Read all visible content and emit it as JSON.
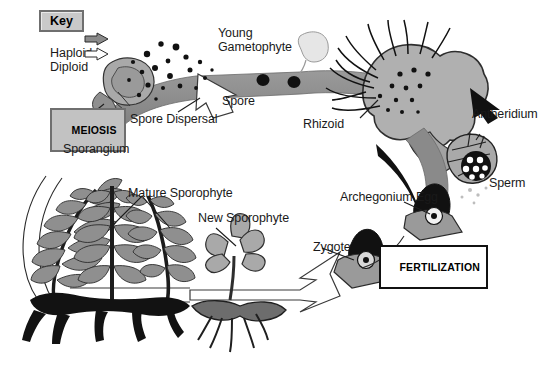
{
  "diagram": {
    "type": "life-cycle-diagram",
    "organism": "fern",
    "background_color": "#ffffff",
    "palette": {
      "haploid_band": "#8a8a8a",
      "diploid_band_outline": "#ffffff",
      "tissue_gray": "#a9a9a9",
      "dark_ink": "#1a1a1a",
      "key_box_fill": "#c9c9c9",
      "key_box_border": "#6f6f6f",
      "meiosis_box_fill": "#c2c2c2",
      "fertilization_box_fill": "#ffffff",
      "fertilization_box_border": "#111111"
    }
  },
  "key": {
    "title": "Key",
    "entries": [
      {
        "label": "Haploid",
        "arrow_style": "filled-gray",
        "arrow_fill": "#8a8a8a"
      },
      {
        "label": "Diploid",
        "arrow_style": "outline-white",
        "arrow_fill": "#ffffff"
      }
    ]
  },
  "process_labels": [
    {
      "name": "meiosis",
      "text": "MEIOSIS",
      "style": "gray-box"
    },
    {
      "name": "fertilization",
      "text": "FERTILIZATION",
      "style": "white-box"
    }
  ],
  "structure_labels": [
    {
      "name": "young-gametophyte",
      "text": "Young\nGametophyte"
    },
    {
      "name": "spore",
      "text": "Spore"
    },
    {
      "name": "spore-dispersal",
      "text": "Spore Dispersal"
    },
    {
      "name": "rhizoid",
      "text": "Rhizoid"
    },
    {
      "name": "antheridium",
      "text": "Antheridium"
    },
    {
      "name": "sperm",
      "text": "Sperm"
    },
    {
      "name": "archegonium-egg",
      "text": "Archegonium Egg"
    },
    {
      "name": "zygote",
      "text": "Zygote"
    },
    {
      "name": "sporangium",
      "text": "Sporangium"
    },
    {
      "name": "mature-sporophyte",
      "text": "Mature Sporophyte"
    },
    {
      "name": "new-sporophyte",
      "text": "New Sporophyte"
    }
  ]
}
